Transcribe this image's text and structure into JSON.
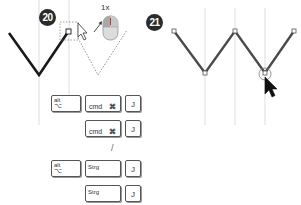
{
  "steps": [
    {
      "number": "20",
      "click_count_label": "1x",
      "shortcuts": {
        "mac": [
          {
            "keys": [
              {
                "top": "alt",
                "bottom": "⌥"
              },
              {
                "left": "cmd",
                "right": "⌘"
              },
              {
                "center": "J"
              }
            ]
          },
          {
            "keys": [
              {
                "left": "cmd",
                "right": "⌘"
              },
              {
                "center": "J"
              }
            ]
          }
        ],
        "separator": "/",
        "windows": [
          {
            "keys": [
              {
                "top": "alt",
                "bottom": "⌥"
              },
              {
                "left": "Strg"
              },
              {
                "center": "J"
              }
            ]
          },
          {
            "keys": [
              {
                "left": "Strg"
              },
              {
                "center": "J"
              }
            ]
          }
        ]
      }
    },
    {
      "number": "21"
    }
  ],
  "colors": {
    "badge_bg": "#2b2b2b",
    "path_left": "#1a1a1a",
    "path_right": "#4a4a4a",
    "guides": "#d0d0d0",
    "mouse_top": "#b0b0b0",
    "mouse_highlight": "#c0392b"
  },
  "icons": [
    "mouse-icon",
    "cursor-arrow-icon",
    "cursor-arrow-black-icon"
  ]
}
